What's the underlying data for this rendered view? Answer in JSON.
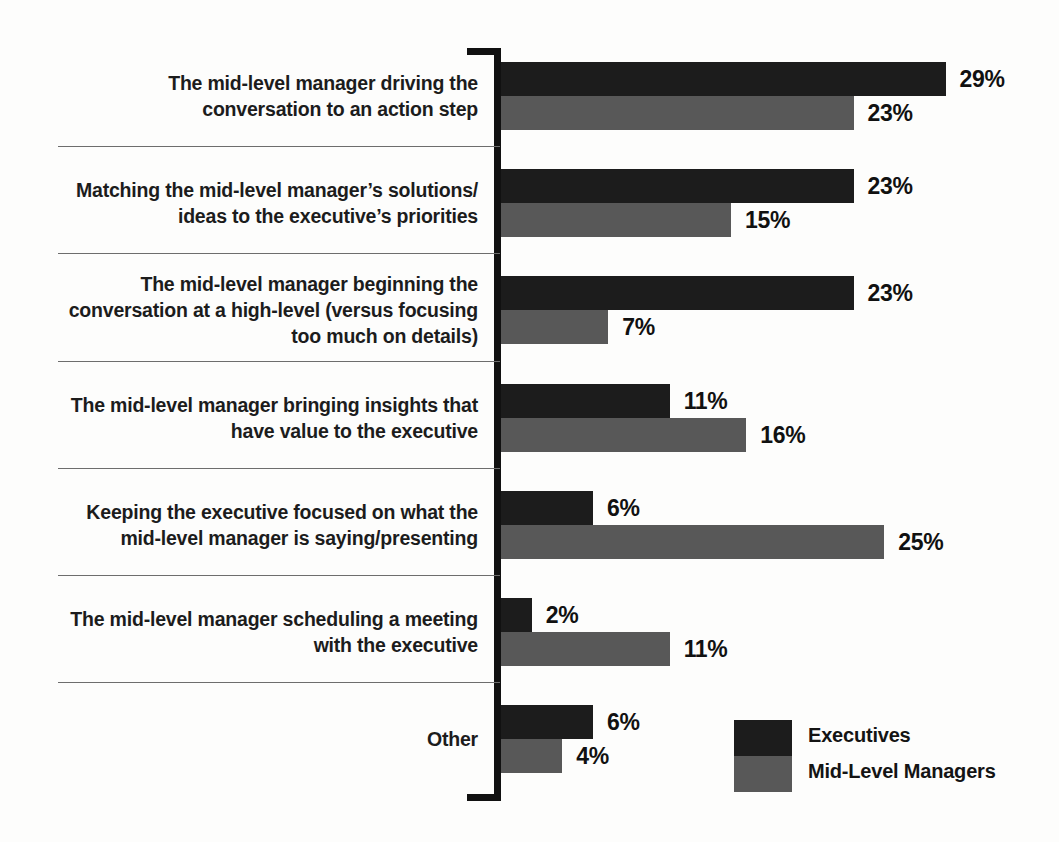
{
  "chart_data": {
    "type": "bar",
    "orientation": "horizontal",
    "title": "",
    "subtitle": "",
    "xlabel": "",
    "ylabel": "",
    "grid": false,
    "value_suffix": "%",
    "xlim": [
      0,
      29
    ],
    "legend_position": "bottom-right",
    "categories": [
      "The mid-level manager driving the conversation to an action step",
      "Matching the mid-level manager’s solutions/ideas to the executive’s priorities",
      "The mid-level manager beginning the conversation at a high-level (versus focusing too much on details)",
      "The mid-level manager bringing insights that have value to the executive",
      "Keeping the executive focused on what the mid-level manager is saying/presenting",
      "The mid-level manager scheduling a meeting with the executive",
      "Other"
    ],
    "category_lines": [
      [
        "The mid-level manager driving the",
        "conversation to an action step"
      ],
      [
        "Matching the mid-level manager’s solutions/",
        "ideas to the executive’s priorities"
      ],
      [
        "The mid-level manager beginning the",
        "conversation at a high-level (versus focusing",
        "too much on details)"
      ],
      [
        "The mid-level manager bringing insights that",
        "have value to the executive"
      ],
      [
        "Keeping the executive focused on what the",
        "mid-level manager is saying/presenting"
      ],
      [
        "The mid-level manager scheduling a meeting",
        "with the executive"
      ],
      [
        "Other"
      ]
    ],
    "series": [
      {
        "name": "Executives",
        "color": "#1c1c1c",
        "values": [
          29,
          23,
          23,
          11,
          6,
          2,
          6
        ],
        "labels": [
          "29%",
          "23%",
          "23%",
          "11%",
          "6%",
          "2%",
          "6%"
        ]
      },
      {
        "name": "Mid-Level Managers",
        "color": "#585858",
        "values": [
          23,
          15,
          7,
          16,
          25,
          11,
          4
        ],
        "labels": [
          "23%",
          "15%",
          "7%",
          "16%",
          "25%",
          "11%",
          "4%"
        ]
      }
    ]
  },
  "legend": {
    "items": [
      {
        "label": "Executives",
        "color": "#1c1c1c"
      },
      {
        "label": "Mid-Level Managers",
        "color": "#585858"
      }
    ]
  },
  "colors": {
    "executives": "#1c1c1c",
    "mid_level_managers": "#585858",
    "axis": "#111111",
    "separator": "#6d6d6d",
    "background": "#fdfdfc"
  }
}
